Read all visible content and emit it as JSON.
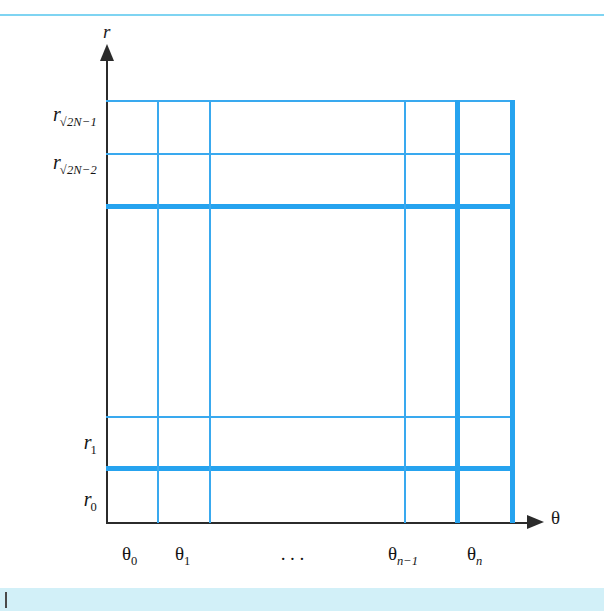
{
  "figure": {
    "type": "grid-diagram",
    "axes": {
      "vertical": {
        "name": "r",
        "arrow": "up-arrow-icon"
      },
      "horizontal": {
        "name": "θ",
        "arrow": "right-arrow-icon"
      }
    },
    "r_ticks": [
      {
        "id": "r-2n-1",
        "base": "r",
        "sub_radical": "√",
        "sub_text": "2N−1",
        "label": "r√2N−1"
      },
      {
        "id": "r-2n-2",
        "base": "r",
        "sub_radical": "√",
        "sub_text": "2N−2",
        "label": "r√2N−2"
      },
      {
        "id": "r-1",
        "base": "r",
        "sub_radical": "",
        "sub_text": "1",
        "label": "r1"
      },
      {
        "id": "r-0",
        "base": "r",
        "sub_radical": "",
        "sub_text": "0",
        "label": "r0"
      }
    ],
    "theta_ticks": [
      {
        "id": "theta-0",
        "base": "θ",
        "sub_text": "0",
        "label": "θ0"
      },
      {
        "id": "theta-1",
        "base": "θ",
        "sub_text": "1",
        "label": "θ1"
      },
      {
        "id": "theta-ellipsis",
        "base": "",
        "sub_text": "",
        "label": "···"
      },
      {
        "id": "theta-n-1",
        "base": "θ",
        "sub_text": "n−1",
        "label": "θn−1"
      },
      {
        "id": "theta-n",
        "base": "θ",
        "sub_text": "n",
        "label": "θn"
      }
    ],
    "colors": {
      "grid_thin": "#39a9ef",
      "grid_thick": "#26a3ef",
      "axis": "#2b2b2b",
      "rule_top": "#7fd4f2",
      "band_bottom": "#d2f0f8",
      "text": "#141414"
    },
    "grid": {
      "horizontal_lines": [
        {
          "id": "h-top",
          "y": 100,
          "weight": "thin",
          "x1": 106,
          "x2": 515
        },
        {
          "id": "h-2",
          "y": 153,
          "weight": "thin",
          "x1": 106,
          "x2": 515
        },
        {
          "id": "h-3",
          "y": 205,
          "weight": "thick",
          "x1": 106,
          "x2": 515
        },
        {
          "id": "h-4",
          "y": 416,
          "weight": "thin",
          "x1": 106,
          "x2": 515
        },
        {
          "id": "h-5",
          "y": 467,
          "weight": "thick",
          "x1": 106,
          "x2": 515
        }
      ],
      "vertical_lines": [
        {
          "id": "v-1",
          "x": 157,
          "weight": "thin",
          "y1": 100,
          "y2": 523
        },
        {
          "id": "v-2",
          "x": 209,
          "weight": "thin",
          "y1": 100,
          "y2": 523
        },
        {
          "id": "v-3",
          "x": 404,
          "weight": "thin",
          "y1": 100,
          "y2": 523
        },
        {
          "id": "v-4",
          "x": 456,
          "weight": "thick",
          "y1": 100,
          "y2": 523
        },
        {
          "id": "v-5",
          "x": 511,
          "weight": "thick",
          "y1": 100,
          "y2": 523
        }
      ]
    }
  }
}
